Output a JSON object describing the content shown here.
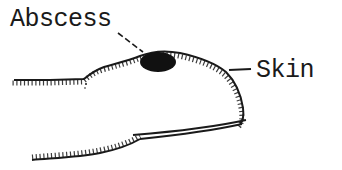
{
  "diagram": {
    "labels": {
      "abscess": "Abscess",
      "skin": "Skin"
    },
    "colors": {
      "ink": "#1a1a1a",
      "background": "#ffffff"
    },
    "parts": [
      "finger-outline",
      "skin-hatching",
      "abscess",
      "fingernail",
      "abscess-leader-line",
      "skin-leader-line"
    ]
  }
}
